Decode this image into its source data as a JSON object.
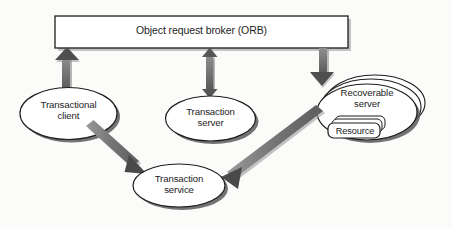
{
  "diagram": {
    "background_color": "#fbfbfa",
    "stroke_color": "#1d1d1d",
    "arrow_color": "#6e6e6e",
    "shadow_color": "#555555",
    "nodes": {
      "orb": {
        "label": "Object request broker (ORB)",
        "shape": "rectangle"
      },
      "transactional_client": {
        "label": "Transactional\nclient",
        "shape": "ellipse"
      },
      "transaction_server": {
        "label": "Transaction\nserver",
        "shape": "ellipse"
      },
      "recoverable_server": {
        "label": "Recoverable\nserver",
        "shape": "ellipse-stack"
      },
      "resource": {
        "label": "Resource",
        "shape": "rounded-rect-stack"
      },
      "transaction_service": {
        "label": "Transaction\nservice",
        "shape": "ellipse"
      }
    },
    "connectors": [
      {
        "name": "client-to-orb",
        "from": "transactional_client",
        "to": "orb",
        "direction": "up",
        "heads": "single"
      },
      {
        "name": "server-orb-bidirectional",
        "from": "transaction_server",
        "to": "orb",
        "direction": "vertical",
        "heads": "double"
      },
      {
        "name": "orb-to-recoverable-server",
        "from": "orb",
        "to": "recoverable_server",
        "direction": "down",
        "heads": "single"
      },
      {
        "name": "client-to-transaction-service",
        "from": "transactional_client",
        "to": "transaction_service",
        "direction": "diagonal-down-right",
        "heads": "single"
      },
      {
        "name": "recoverable-server-to-transaction-service",
        "from": "recoverable_server",
        "to": "transaction_service",
        "direction": "diagonal-down-left",
        "heads": "single"
      }
    ]
  }
}
